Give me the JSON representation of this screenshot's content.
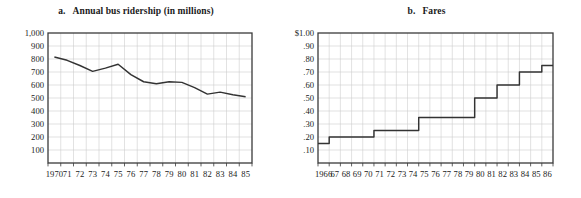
{
  "figure": {
    "panels": [
      {
        "key": "a",
        "label": "a.",
        "title": "Annual bus ridership (in millions)"
      },
      {
        "key": "b",
        "label": "b.",
        "title": "Fares"
      }
    ]
  },
  "chart_data": [
    {
      "type": "line",
      "title": "Annual bus ridership (in millions)",
      "panel_label": "a.",
      "xlabel": "",
      "ylabel": "",
      "grid": true,
      "legend": "none",
      "xlim": [
        1970,
        1985
      ],
      "ylim": [
        0,
        1000
      ],
      "ytick_labels": [
        "1,000",
        "900",
        "800",
        "700",
        "600",
        "500",
        "400",
        "300",
        "200",
        "100"
      ],
      "ytick_values": [
        1000,
        900,
        800,
        700,
        600,
        500,
        400,
        300,
        200,
        100
      ],
      "xtick_labels": [
        "1970",
        "71",
        "72",
        "73",
        "74",
        "75",
        "76",
        "77",
        "78",
        "79",
        "80",
        "81",
        "82",
        "83",
        "84",
        "85"
      ],
      "x": [
        1970,
        1971,
        1972,
        1973,
        1974,
        1975,
        1976,
        1977,
        1978,
        1979,
        1980,
        1981,
        1982,
        1983,
        1984,
        1985
      ],
      "values": [
        815,
        790,
        750,
        705,
        730,
        760,
        680,
        625,
        610,
        625,
        620,
        580,
        530,
        545,
        525,
        510
      ],
      "line_color": "#333333"
    },
    {
      "type": "line",
      "subtype": "step",
      "title": "Fares",
      "panel_label": "b.",
      "xlabel": "",
      "ylabel": "",
      "grid": true,
      "legend": "none",
      "xlim": [
        1966,
        1986
      ],
      "ylim": [
        0,
        1.0
      ],
      "ytick_labels": [
        "$1.00",
        ".90",
        ".80",
        ".70",
        ".60",
        ".50",
        ".40",
        ".30",
        ".20",
        ".10"
      ],
      "ytick_values": [
        1.0,
        0.9,
        0.8,
        0.7,
        0.6,
        0.5,
        0.4,
        0.3,
        0.2,
        0.1
      ],
      "xtick_labels": [
        "1966",
        "67",
        "68",
        "69",
        "70",
        "71",
        "72",
        "73",
        "74",
        "75",
        "76",
        "77",
        "78",
        "79",
        "80",
        "81",
        "82",
        "83",
        "84",
        "85",
        "86"
      ],
      "x": [
        1966,
        1967,
        1968,
        1969,
        1970,
        1971,
        1972,
        1973,
        1974,
        1975,
        1976,
        1977,
        1978,
        1979,
        1980,
        1981,
        1982,
        1983,
        1984,
        1985,
        1986
      ],
      "values": [
        0.15,
        0.2,
        0.2,
        0.2,
        0.2,
        0.25,
        0.25,
        0.25,
        0.25,
        0.35,
        0.35,
        0.35,
        0.35,
        0.35,
        0.5,
        0.5,
        0.6,
        0.6,
        0.7,
        0.7,
        0.75
      ],
      "line_color": "#333333"
    }
  ]
}
